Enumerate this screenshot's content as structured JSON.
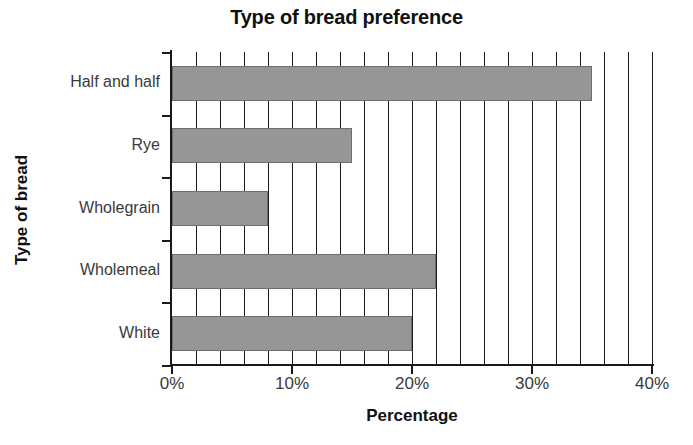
{
  "chart_data": {
    "type": "bar",
    "orientation": "horizontal",
    "title": "Type of bread preference",
    "xlabel": "Percentage",
    "ylabel": "Type of bread",
    "categories": [
      "White",
      "Wholemeal",
      "Wholegrain",
      "Rye",
      "Half and half"
    ],
    "values": [
      20,
      22,
      8,
      15,
      35
    ],
    "xlim": [
      0,
      40
    ],
    "x_tick_labels": [
      "0%",
      "10%",
      "20%",
      "30%",
      "40%"
    ],
    "x_tick_values": [
      0,
      10,
      20,
      30,
      40
    ],
    "gridline_interval": 2,
    "grid": true,
    "legend": "none",
    "bar_color": "#969696",
    "bar_border_color": "#6e6e6e",
    "axis_color": "#1a1a1a",
    "text_color": "#3a3a3a",
    "title_color": "#111111",
    "background": "#ffffff"
  }
}
